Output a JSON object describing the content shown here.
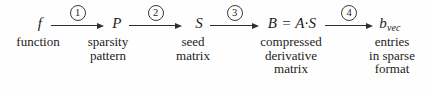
{
  "diagram": {
    "background_color": "#fefefe",
    "text_color": "#1c1c1c",
    "nodes": [
      {
        "symbol": "f",
        "label_lines": [
          "function"
        ]
      },
      {
        "symbol": "P",
        "label_lines": [
          "sparsity",
          "pattern"
        ]
      },
      {
        "symbol": "S",
        "label_lines": [
          "seed",
          "matrix"
        ]
      },
      {
        "symbol": "B = A·S",
        "label_lines": [
          "compressed",
          "derivative",
          "matrix"
        ]
      },
      {
        "symbol": "b",
        "subscript": "vec",
        "label_lines": [
          "entries",
          "in sparse",
          "format"
        ]
      }
    ],
    "steps": [
      {
        "number": "1"
      },
      {
        "number": "2"
      },
      {
        "number": "3"
      },
      {
        "number": "4"
      }
    ]
  }
}
